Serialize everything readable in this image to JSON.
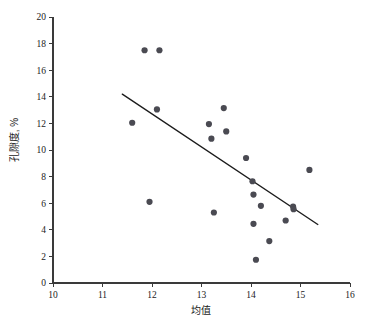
{
  "chart_data": {
    "type": "scatter",
    "title": "",
    "xlabel": "均值",
    "ylabel": "孔隙度, %",
    "xlim": [
      10,
      16
    ],
    "ylim": [
      0,
      20
    ],
    "xticks": [
      10,
      11,
      12,
      13,
      14,
      15,
      16
    ],
    "yticks": [
      0,
      2,
      4,
      6,
      8,
      10,
      12,
      14,
      16,
      18,
      20
    ],
    "xtick_labels": [
      "10",
      "11",
      "12",
      "13",
      "14",
      "15",
      "16"
    ],
    "ytick_labels": [
      "0",
      "2",
      "4",
      "6",
      "8",
      "10",
      "12",
      "14",
      "16",
      "18",
      "20"
    ],
    "grid": false,
    "legend": false,
    "legend_position": "none",
    "marker_color": "#4a4a52",
    "marker_size": 3.1,
    "series": [
      {
        "name": "孔隙度 vs 均值",
        "points": [
          {
            "x": 11.6,
            "y": 12.05
          },
          {
            "x": 11.85,
            "y": 17.5
          },
          {
            "x": 11.95,
            "y": 6.1
          },
          {
            "x": 12.1,
            "y": 13.05
          },
          {
            "x": 12.15,
            "y": 17.5
          },
          {
            "x": 13.15,
            "y": 11.95
          },
          {
            "x": 13.2,
            "y": 10.85
          },
          {
            "x": 13.25,
            "y": 5.3
          },
          {
            "x": 13.45,
            "y": 13.15
          },
          {
            "x": 13.5,
            "y": 11.4
          },
          {
            "x": 13.9,
            "y": 9.4
          },
          {
            "x": 14.03,
            "y": 7.65
          },
          {
            "x": 14.05,
            "y": 6.65
          },
          {
            "x": 14.05,
            "y": 4.45
          },
          {
            "x": 14.1,
            "y": 1.75
          },
          {
            "x": 14.2,
            "y": 5.8
          },
          {
            "x": 14.37,
            "y": 3.15
          },
          {
            "x": 14.7,
            "y": 4.7
          },
          {
            "x": 14.85,
            "y": 5.75
          },
          {
            "x": 14.86,
            "y": 5.55
          },
          {
            "x": 15.18,
            "y": 8.5
          }
        ]
      }
    ],
    "trend_line": {
      "name": "regression-line",
      "x1": 11.4,
      "y1": 14.2,
      "x2": 15.35,
      "y2": 4.4,
      "color": "#1c1c1c"
    }
  }
}
